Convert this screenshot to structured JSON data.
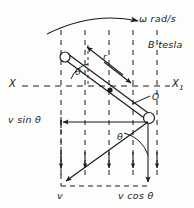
{
  "figure": {
    "labels": {
      "omega": "ω rad/s",
      "bfield": "B tesla",
      "axis_left": "X",
      "axis_right": "X",
      "axis_right_sub": "1",
      "origin": "O",
      "radius": "r",
      "theta_rod": "θ",
      "theta_velocity": "θ",
      "v_sin_theta": "v sin θ",
      "v": "v",
      "v_cos_theta": "v cos θ"
    },
    "colors": {
      "ink": "#1a1a1a",
      "paper": "#fdfdfc"
    }
  },
  "geometry": {
    "pivot": {
      "x": 88,
      "y": 86
    },
    "rod_top_end": {
      "x": 64,
      "y": 56
    },
    "rod_bottom_end": {
      "x": 148,
      "y": 117
    },
    "axis_y": 86,
    "axis_x_start": 22,
    "axis_x_end": 170,
    "field_line_x": [
      61,
      85,
      109,
      133,
      157
    ],
    "field_line_top": 30,
    "field_line_bottom": 186,
    "velocity_rect": {
      "left": 61,
      "top": 120,
      "right": 148,
      "bottom": 186
    },
    "rotation_arc": {
      "start_x": 47,
      "start_y": 33,
      "end_x": 140,
      "end_y": 20
    }
  }
}
